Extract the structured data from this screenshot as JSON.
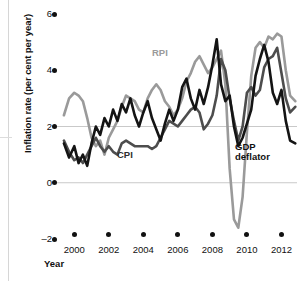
{
  "chart_data": {
    "type": "line",
    "title": "",
    "xlabel": "Year",
    "ylabel": "Inflation rate (per cent per year)",
    "xlim": [
      1999.0,
      2012.9
    ],
    "ylim": [
      -2,
      6
    ],
    "grid": true,
    "gridlines_y": [
      2,
      0
    ],
    "legend_position": "inline-annotations",
    "y_ticks": [
      6,
      4,
      2,
      0,
      -2
    ],
    "y_tick_labels": [
      "6",
      "4",
      "2",
      "0",
      "–2"
    ],
    "x_ticks": [
      2000,
      2002,
      2004,
      2006,
      2008,
      2010,
      2012
    ],
    "x_tick_labels": [
      "2000",
      "2002",
      "2004",
      "2006",
      "2008",
      "2010",
      "2012"
    ],
    "colors": {
      "rpi": "#9a9a9a",
      "cpi": "#4d4d4d",
      "gdp_deflator": "#141414",
      "gridline": "#c9c9c9",
      "axis_text": "#111111"
    },
    "series": [
      {
        "name": "RPI",
        "color": "#9a9a9a",
        "label_text": "RPI",
        "x": [
          1999.4,
          1999.7,
          2000.0,
          2000.25,
          2000.5,
          2000.75,
          2001.0,
          2001.25,
          2001.5,
          2001.75,
          2002.0,
          2002.25,
          2002.5,
          2002.75,
          2003.0,
          2003.25,
          2003.5,
          2003.75,
          2004.0,
          2004.25,
          2004.5,
          2004.75,
          2005.0,
          2005.25,
          2005.5,
          2005.75,
          2006.0,
          2006.25,
          2006.5,
          2006.75,
          2007.0,
          2007.25,
          2007.5,
          2007.75,
          2008.0,
          2008.25,
          2008.5,
          2008.75,
          2009.0,
          2009.25,
          2009.5,
          2009.75,
          2010.0,
          2010.25,
          2010.5,
          2010.75,
          2011.0,
          2011.25,
          2011.5,
          2011.75,
          2012.0,
          2012.25,
          2012.5,
          2012.8
        ],
        "values": [
          2.4,
          3.0,
          3.2,
          3.1,
          2.9,
          2.3,
          1.6,
          1.3,
          1.5,
          1.0,
          1.6,
          1.9,
          2.2,
          2.7,
          3.1,
          3.0,
          2.9,
          2.6,
          2.5,
          3.0,
          3.3,
          3.5,
          3.3,
          2.9,
          2.7,
          2.4,
          2.6,
          3.0,
          3.6,
          3.9,
          4.3,
          4.5,
          4.2,
          3.9,
          4.1,
          4.4,
          4.7,
          3.5,
          0.5,
          -1.3,
          -1.6,
          -0.5,
          1.8,
          3.8,
          4.8,
          5.0,
          4.8,
          5.2,
          5.1,
          5.3,
          5.2,
          4.0,
          3.1,
          2.9
        ]
      },
      {
        "name": "CPI",
        "color": "#4d4d4d",
        "label_text": "CPI",
        "x": [
          1999.4,
          1999.7,
          2000.0,
          2000.25,
          2000.5,
          2000.75,
          2001.0,
          2001.25,
          2001.5,
          2001.75,
          2002.0,
          2002.25,
          2002.5,
          2002.75,
          2003.0,
          2003.25,
          2003.5,
          2003.75,
          2004.0,
          2004.25,
          2004.5,
          2004.75,
          2005.0,
          2005.25,
          2005.5,
          2005.75,
          2006.0,
          2006.25,
          2006.5,
          2006.75,
          2007.0,
          2007.25,
          2007.5,
          2007.75,
          2008.0,
          2008.25,
          2008.5,
          2008.75,
          2009.0,
          2009.25,
          2009.5,
          2009.75,
          2010.0,
          2010.25,
          2010.5,
          2010.75,
          2011.0,
          2011.25,
          2011.5,
          2011.75,
          2012.0,
          2012.25,
          2012.5,
          2012.8
        ],
        "values": [
          1.5,
          1.1,
          0.8,
          0.9,
          0.7,
          1.0,
          1.3,
          1.6,
          1.3,
          1.1,
          1.3,
          1.1,
          1.0,
          1.4,
          1.5,
          1.4,
          1.3,
          1.3,
          1.3,
          1.3,
          1.2,
          1.3,
          1.6,
          1.9,
          2.2,
          2.1,
          2.0,
          2.2,
          2.4,
          2.6,
          2.7,
          2.5,
          1.9,
          2.1,
          2.4,
          3.1,
          4.4,
          4.0,
          3.0,
          2.2,
          1.5,
          2.0,
          3.2,
          3.4,
          3.1,
          3.3,
          4.1,
          4.4,
          4.5,
          4.8,
          3.9,
          3.0,
          2.5,
          2.7
        ]
      },
      {
        "name": "GDP deflator",
        "color": "#141414",
        "label_text": "GDP deflator",
        "x": [
          1999.4,
          1999.7,
          2000.0,
          2000.25,
          2000.5,
          2000.75,
          2001.0,
          2001.25,
          2001.5,
          2001.75,
          2002.0,
          2002.25,
          2002.5,
          2002.75,
          2003.0,
          2003.25,
          2003.5,
          2003.75,
          2004.0,
          2004.25,
          2004.5,
          2004.75,
          2005.0,
          2005.25,
          2005.5,
          2005.75,
          2006.0,
          2006.25,
          2006.5,
          2006.75,
          2007.0,
          2007.25,
          2007.5,
          2007.75,
          2008.0,
          2008.25,
          2008.5,
          2008.75,
          2009.0,
          2009.25,
          2009.5,
          2009.75,
          2010.0,
          2010.25,
          2010.5,
          2010.75,
          2011.0,
          2011.25,
          2011.5,
          2011.75,
          2012.0,
          2012.25,
          2012.5,
          2012.8
        ],
        "values": [
          1.4,
          0.9,
          1.3,
          0.7,
          1.0,
          0.6,
          1.4,
          2.0,
          1.7,
          2.3,
          2.0,
          2.6,
          2.2,
          2.8,
          2.5,
          3.0,
          2.4,
          2.0,
          2.5,
          2.9,
          2.3,
          1.9,
          1.5,
          2.1,
          2.6,
          2.2,
          2.6,
          3.4,
          3.7,
          3.0,
          2.6,
          3.3,
          2.8,
          3.4,
          4.2,
          5.1,
          3.5,
          2.9,
          3.1,
          2.0,
          1.3,
          1.6,
          2.1,
          2.6,
          3.8,
          4.4,
          4.9,
          4.3,
          3.2,
          2.8,
          3.3,
          2.2,
          1.5,
          1.4
        ]
      }
    ]
  }
}
